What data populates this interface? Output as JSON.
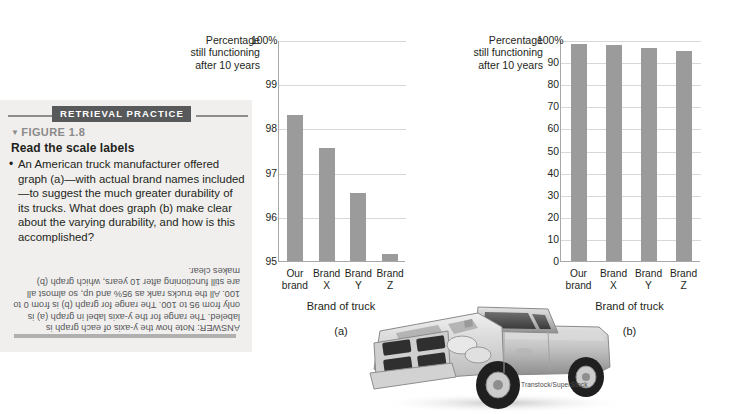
{
  "retrieval_panel": {
    "banner_label": "RETRIEVAL PRACTICE",
    "figure_number": "FIGURE 1.8",
    "figure_caret": "▼",
    "figure_title": "Read the scale labels",
    "bullet_marker": "•",
    "bullet_text": "An American truck manufacturer offered graph (a)—with actual brand names included—to suggest the much greater durability of its trucks. What does graph (b) make clear about the varying durability, and how is this accomplished?",
    "answer_text": "ANSWER: Note how the y-axis of each graph is labeled. The range for the y-axis label in graph (a) is only from 95 to 100. The range for graph (b) is from 0 to 100. All the trucks rank as 95% and up, so almost all are still functioning after 10 years, which graph (b) makes clear."
  },
  "photo": {
    "name": "pickup-truck-photo",
    "credit": "Transtock/SuperStock"
  },
  "colors": {
    "bar": "#9b9b9b",
    "gridline": "#d8d8d8",
    "axis": "#a8a8a8",
    "panel_background": "#f0efed",
    "banner_background": "#58595b",
    "text": "#231f20"
  },
  "chart_data": [
    {
      "id": "graph-a",
      "type": "bar",
      "title": "",
      "panel_letter": "(a)",
      "ylabel": "Percentage still functioning after 10 years",
      "ylabel_lines": [
        "Percentage",
        "still functioning",
        "after 10 years"
      ],
      "xlabel": "Brand of truck",
      "categories": [
        "Our brand",
        "Brand X",
        "Brand Y",
        "Brand Z"
      ],
      "category_lines": [
        [
          "Our",
          "brand"
        ],
        [
          "Brand",
          "X"
        ],
        [
          "Brand",
          "Y"
        ],
        [
          "Brand",
          "Z"
        ]
      ],
      "values": [
        98.3,
        97.55,
        96.55,
        95.15
      ],
      "ylim": [
        95,
        100
      ],
      "yticks": [
        95,
        96,
        97,
        98,
        99,
        100
      ],
      "ytick_labels": [
        "95",
        "96",
        "97",
        "98",
        "99",
        "100%"
      ],
      "grid": true,
      "legend": "none"
    },
    {
      "id": "graph-b",
      "type": "bar",
      "title": "",
      "panel_letter": "(b)",
      "ylabel": "Percentage still functioning after 10 years",
      "ylabel_lines": [
        "Percentage",
        "still functioning",
        "after 10 years"
      ],
      "xlabel": "Brand of truck",
      "categories": [
        "Our brand",
        "Brand X",
        "Brand Y",
        "Brand Z"
      ],
      "category_lines": [
        [
          "Our",
          "brand"
        ],
        [
          "Brand",
          "X"
        ],
        [
          "Brand",
          "Y"
        ],
        [
          "Brand",
          "Z"
        ]
      ],
      "values": [
        98.3,
        97.55,
        96.55,
        95.15
      ],
      "ylim": [
        0,
        100
      ],
      "yticks": [
        0,
        10,
        20,
        30,
        40,
        50,
        60,
        70,
        80,
        90,
        100
      ],
      "ytick_labels": [
        "0",
        "10",
        "20",
        "30",
        "40",
        "50",
        "60",
        "70",
        "80",
        "90",
        "100%"
      ],
      "grid": true,
      "legend": "none"
    }
  ]
}
